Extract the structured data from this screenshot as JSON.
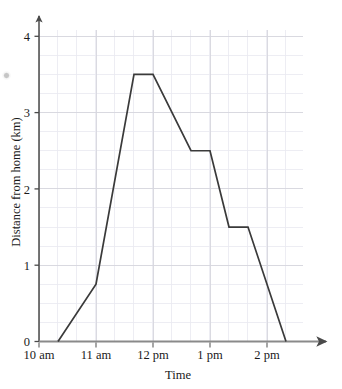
{
  "chart_data": {
    "type": "line",
    "title": "",
    "xlabel": "Time",
    "ylabel": "Distance from home (km)",
    "xlim": [
      10,
      14.6
    ],
    "ylim": [
      0,
      4.35
    ],
    "grid": true,
    "legend": "none",
    "x_tick_labels": [
      "10 am",
      "11 am",
      "12 pm",
      "1 pm",
      "2 pm"
    ],
    "x_tick_values": [
      10,
      11,
      12,
      13,
      14
    ],
    "y_tick_labels": [
      "0",
      "1",
      "2",
      "3",
      "4"
    ],
    "y_tick_values": [
      0,
      1,
      2,
      3,
      4
    ],
    "x_minor_step": 0.3333333,
    "y_minor_step": 0.25,
    "x_axis_arrow": true,
    "y_axis_arrow": true,
    "series": [
      {
        "name": "Distance from home",
        "color": "#3a3a3a",
        "x": [
          10.3333,
          11.0,
          11.6667,
          12.0,
          12.6667,
          13.0,
          13.3333,
          13.6667,
          14.3333
        ],
        "y": [
          0,
          0.75,
          3.5,
          3.5,
          2.5,
          2.5,
          1.5,
          1.5,
          0
        ],
        "x_time_labels": [
          "10:20 am",
          "11:00 am",
          "11:40 am",
          "12:00 pm",
          "12:40 pm",
          "1:00 pm",
          "1:20 pm",
          "1:40 pm",
          "2:20 pm"
        ]
      }
    ]
  },
  "axes": {
    "x_title": "Time",
    "y_title": "Distance from home (km)"
  },
  "colors": {
    "line": "#3a3a3a",
    "axis": "#4a4a4a",
    "grid_major": "#d5d5dd",
    "grid_minor": "#e8e8ef",
    "text": "#1a1a1a",
    "background": "#ffffff"
  }
}
